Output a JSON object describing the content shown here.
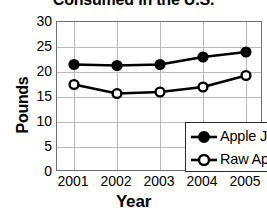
{
  "chart_data": {
    "type": "line",
    "title": "Consumed in the U.S.",
    "title_note": "title is clipped at top edge of image",
    "xlabel": "Year",
    "ylabel": "Pounds",
    "categories": [
      "2001",
      "2002",
      "2003",
      "2004",
      "2005"
    ],
    "ylim": [
      0,
      30
    ],
    "yticks": [
      "0",
      "5",
      "10",
      "15",
      "20",
      "25",
      "30"
    ],
    "grid": true,
    "legend_position": "lower-right inside plot",
    "series": [
      {
        "name": "Apple Juice",
        "marker": "filled-circle",
        "color": "#000000",
        "values": [
          21.5,
          21.3,
          21.5,
          23.0,
          24.0
        ]
      },
      {
        "name": "Raw Apples",
        "marker": "open-circle",
        "color": "#000000",
        "values": [
          17.5,
          15.7,
          16.0,
          17.0,
          19.3
        ]
      }
    ]
  },
  "axis": {
    "y_title": "Pounds",
    "x_title": "Year",
    "y_ticks": [
      "30",
      "25",
      "20",
      "15",
      "10",
      "5",
      "0"
    ],
    "x_ticks": [
      "2001",
      "2002",
      "2003",
      "2004",
      "2005"
    ]
  },
  "legend": {
    "items": [
      {
        "label": "Apple Juice",
        "marker": "filled-circle-icon"
      },
      {
        "label": "Raw Apples",
        "marker": "open-circle-icon"
      }
    ]
  }
}
